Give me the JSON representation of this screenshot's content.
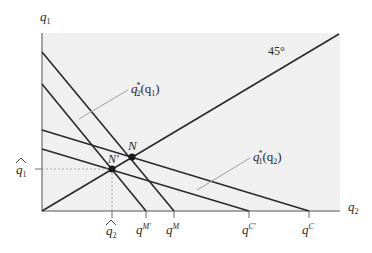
{
  "diagram": {
    "type": "reaction-function-diagram",
    "axes": {
      "y_label": "q₁",
      "x_label": "q₂"
    },
    "angle_label": "45°",
    "curves": [
      {
        "id": "r2-shifted",
        "label": "q₂*(q₁)",
        "x_intercept_label": "qᴹ",
        "description": "firm 2 reaction function"
      },
      {
        "id": "r2-original",
        "label": "",
        "x_intercept_label": "qᴹ'",
        "description": "firm 2 reaction function (shifted)"
      },
      {
        "id": "r1-original",
        "label": "q₁*(q₂)",
        "x_intercept_label": "qᶜ",
        "description": "firm 1 reaction function"
      },
      {
        "id": "r1-shifted",
        "label": "",
        "x_intercept_label": "qᶜ'",
        "description": "firm 1 reaction function (shifted)"
      }
    ],
    "points": [
      {
        "id": "N",
        "label": "N"
      },
      {
        "id": "N-prime",
        "label": "N'"
      }
    ],
    "annotations": {
      "q1_hat": "q̂₁",
      "q2_hat": "q̂₂",
      "r2_label_base": "q",
      "r2_label_sub": "2",
      "r2_label_sup": "*",
      "r2_label_arg": "(q",
      "r2_label_arg_sub": "1",
      "r2_label_close": ")",
      "r1_label_base": "q",
      "r1_label_sub": "1",
      "r1_label_sup": "*",
      "r1_label_arg": "(q",
      "r1_label_arg_sub": "2",
      "r1_label_close": ")"
    },
    "tick_labels": {
      "q2_hat_base": "q",
      "q2_hat_sub": "2",
      "qM_prime_base": "q",
      "qM_prime_sup": "M'",
      "qM_base": "q",
      "qM_sup": "M",
      "qC_prime_base": "q",
      "qC_prime_sup": "C'",
      "qC_base": "q",
      "qC_sup": "C",
      "q1_hat_base": "q",
      "q1_hat_sub": "1"
    },
    "axis_labels": {
      "y_base": "q",
      "y_sub": "1",
      "x_base": "q",
      "x_sub": "2"
    },
    "colors": {
      "background_panel": "#f0f0f0",
      "line": "#2a2a2a",
      "axis": "#8a8a8a",
      "pointer": "#a0a0a0",
      "dashed": "#9a9a9a"
    }
  }
}
